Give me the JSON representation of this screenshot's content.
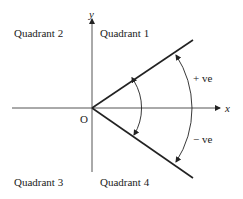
{
  "diagram": {
    "axes": {
      "x_label": "x",
      "y_label": "y",
      "origin_label": "O"
    },
    "quadrants": {
      "q1": "Quadrant 1",
      "q2": "Quadrant 2",
      "q3": "Quadrant 3",
      "q4": "Quadrant 4"
    },
    "angle_labels": {
      "positive": "+ ve",
      "negative": "− ve"
    },
    "colors": {
      "line": "#222222",
      "axis": "#555555",
      "background": "#ffffff"
    }
  }
}
